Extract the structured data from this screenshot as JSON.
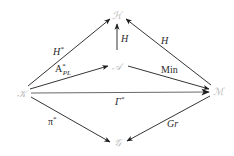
{
  "diagram": {
    "type": "commutative-diagram",
    "nodes": {
      "K": {
        "label": "𝒦",
        "x": 22,
        "y": 93
      },
      "H": {
        "label": "ℋ",
        "x": 117,
        "y": 15
      },
      "A": {
        "label": "𝒜",
        "x": 117,
        "y": 66
      },
      "M": {
        "label": "ℳ",
        "x": 217,
        "y": 91
      },
      "G": {
        "label": "𝒢",
        "x": 119,
        "y": 142
      }
    },
    "edges": [
      {
        "from": "K",
        "to": "H",
        "label": "H",
        "sup": "*"
      },
      {
        "from": "K",
        "to": "A",
        "label": "A",
        "sup": "*",
        "sub": "PL"
      },
      {
        "from": "K",
        "to": "M",
        "label": "Γ",
        "sup": "*"
      },
      {
        "from": "K",
        "to": "G",
        "label": "π",
        "sup": "*"
      },
      {
        "from": "A",
        "to": "H",
        "label": "H"
      },
      {
        "from": "M",
        "to": "H",
        "label": "H"
      },
      {
        "from": "A",
        "to": "M",
        "label": "Min"
      },
      {
        "from": "M",
        "to": "G",
        "label": "Gr"
      }
    ]
  },
  "colors": {
    "node": "#b8b8b8",
    "edge": "#1e1e1e",
    "label": "#2a2a2a"
  }
}
